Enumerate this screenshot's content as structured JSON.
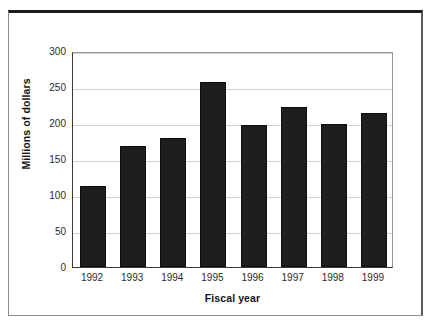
{
  "chart_data": {
    "type": "bar",
    "title": "",
    "subtitle": "",
    "xlabel": "Fiscal year",
    "ylabel": "Millions of dollars",
    "categories": [
      "1992",
      "1993",
      "1994",
      "1995",
      "1996",
      "1997",
      "1998",
      "1999"
    ],
    "values": [
      112,
      168,
      179,
      257,
      197,
      222,
      199,
      214
    ],
    "ylim": [
      0,
      300
    ],
    "yticks": [
      0,
      50,
      100,
      150,
      200,
      250,
      300
    ],
    "ytick_labels": [
      "0",
      "50",
      "100",
      "150",
      "200",
      "250",
      "300"
    ],
    "xtick_labels": [
      "1992",
      "1993",
      "1994",
      "1995",
      "1996",
      "1997",
      "1998",
      "1999"
    ],
    "grid": "horizontal",
    "legend": "none",
    "annotations": [],
    "colors": {
      "bar": "#1e1e1e",
      "bar_edge": "#0d0d0d",
      "gridline": "#d2d2d2",
      "axis": "#3a3a3a",
      "text": "#2b2b2b",
      "axis_title": "#151515",
      "background": "#ffffff",
      "outer_frame": "#1c1c1c"
    }
  }
}
